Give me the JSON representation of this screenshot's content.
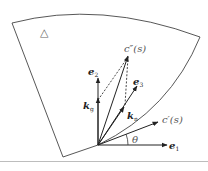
{
  "figure": {
    "region_marker": "△",
    "vectors": {
      "e1": {
        "base": "e",
        "sub": "1"
      },
      "e2": {
        "base": "e",
        "sub": "2"
      },
      "e3": {
        "base": "e",
        "sub": "3"
      },
      "kg": {
        "base": "k",
        "sub": "g"
      },
      "kn": {
        "base": "k",
        "sub": "n"
      }
    },
    "curve_labels": {
      "c_prime": "c′(s)",
      "c_double_prime": "c″(s)"
    },
    "angle_label": "θ",
    "colors": {
      "stroke": "#333333",
      "label": "#222222",
      "rule": "#bdbdbd"
    }
  }
}
